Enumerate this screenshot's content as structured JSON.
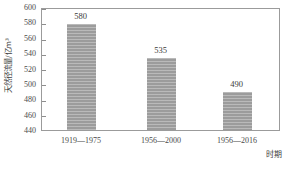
{
  "chart_data": {
    "type": "bar",
    "title": "",
    "xlabel": "时期",
    "ylabel": "天然径流量/亿m³",
    "categories": [
      "1919—1975",
      "1956—2000",
      "1956—2016"
    ],
    "values": [
      580,
      535,
      490
    ],
    "value_labels": [
      "580",
      "535",
      "490"
    ],
    "ylim": [
      440,
      600
    ],
    "ytick_step": 20,
    "yticks": [
      600,
      580,
      560,
      540,
      520,
      500,
      480,
      460,
      440
    ],
    "ytick_labels": [
      "600",
      "580",
      "560",
      "540",
      "520",
      "500",
      "480",
      "460",
      "440"
    ],
    "grid": false,
    "legend": false,
    "legend_position": "none",
    "bar_color": "#9c9c9c",
    "bar_pattern": "horizontal-hatch",
    "frame_color": "#9b9b9b",
    "background": "#ffffff"
  }
}
